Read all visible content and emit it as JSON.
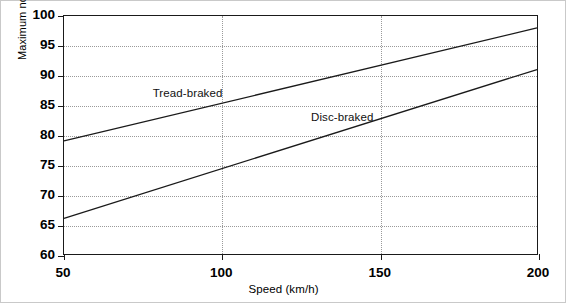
{
  "chart_data": {
    "type": "line",
    "title": "",
    "xlabel": "Speed (km/h)",
    "ylabel": "Maximum noise level (dBA)",
    "xlim": [
      50,
      200
    ],
    "ylim": [
      60,
      100
    ],
    "xticks": [
      50,
      100,
      150,
      200
    ],
    "xticklabels": [
      "50",
      "100",
      "150",
      "200"
    ],
    "yticks": [
      60,
      65,
      70,
      75,
      80,
      85,
      90,
      95,
      100
    ],
    "yticklabels": [
      "60",
      "65",
      "70",
      "75",
      "80",
      "85",
      "90",
      "95",
      "100"
    ],
    "grid": "dotted horizontal at every y tick; dotted vertical at x = 100 and 150",
    "legend_position": "inline annotations next to each line",
    "series": [
      {
        "name": "Tread-braked",
        "x": [
          50,
          200
        ],
        "values": [
          79,
          98
        ],
        "label_x": 78,
        "label_y": 87,
        "color": "#1a1a1a"
      },
      {
        "name": "Disc-braked",
        "x": [
          50,
          200
        ],
        "values": [
          66,
          91
        ],
        "label_x": 128,
        "label_y": 83,
        "color": "#1a1a1a"
      }
    ]
  },
  "axes": {
    "x_title": "Speed (km/h)",
    "y_title": "Maximum noise level (dBA)"
  },
  "ticks": {
    "y": [
      "100",
      "95",
      "90",
      "85",
      "80",
      "75",
      "70",
      "65",
      "60"
    ],
    "x": [
      "50",
      "100",
      "150",
      "200"
    ]
  },
  "annotations": {
    "tread": "Tread-braked",
    "disc": "Disc-braked"
  },
  "colors": {
    "line": "#1a1a1a",
    "grid": "#9a9a9a",
    "axis": "#1a1a1a",
    "background": "#ffffff",
    "page_border": "#c9c9c9"
  }
}
